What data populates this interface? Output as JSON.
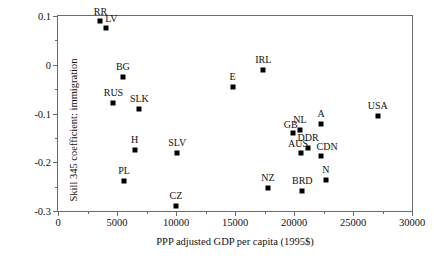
{
  "chart_data": {
    "type": "scatter",
    "title": "",
    "xlabel": "PPP adjusted GDP per capita (1995$)",
    "ylabel": "Skill 345 coefficient: immigration",
    "xlim": [
      0,
      30000
    ],
    "ylim": [
      -0.3,
      0.1
    ],
    "grid": false,
    "legend": "none",
    "xticks": [
      {
        "value": 0,
        "label": "0"
      },
      {
        "value": 5000,
        "label": "5000"
      },
      {
        "value": 10000,
        "label": "10000"
      },
      {
        "value": 15000,
        "label": "15000"
      },
      {
        "value": 20000,
        "label": "20000"
      },
      {
        "value": 25000,
        "label": "25000"
      },
      {
        "value": 30000,
        "label": "30000"
      }
    ],
    "xminorticks": [
      2500,
      7500,
      12500,
      17500,
      22500,
      27500
    ],
    "yticks": [
      {
        "value": 0.1,
        "label": "0.1"
      },
      {
        "value": 0,
        "label": "0"
      },
      {
        "value": -0.1,
        "label": "-0.1"
      },
      {
        "value": -0.2,
        "label": "-0.2"
      },
      {
        "value": -0.3,
        "label": "-0.3"
      }
    ],
    "yminorticks": [
      0.05,
      -0.05,
      -0.15,
      -0.25
    ],
    "points": [
      {
        "label": "RR",
        "x": 3600,
        "y": 0.089,
        "label_dx": 0,
        "label_dy": -4
      },
      {
        "label": "LV",
        "x": 4100,
        "y": 0.075,
        "label_dx": 5,
        "label_dy": -4
      },
      {
        "label": "BG",
        "x": 5500,
        "y": -0.025,
        "label_dx": 0,
        "label_dy": -5
      },
      {
        "label": "RUS",
        "x": 4700,
        "y": -0.078,
        "label_dx": 0,
        "label_dy": -5
      },
      {
        "label": "SLK",
        "x": 6900,
        "y": -0.091,
        "label_dx": 0,
        "label_dy": -5
      },
      {
        "label": "H",
        "x": 6500,
        "y": -0.175,
        "label_dx": 0,
        "label_dy": -5
      },
      {
        "label": "PL",
        "x": 5600,
        "y": -0.238,
        "label_dx": 0,
        "label_dy": -5
      },
      {
        "label": "SLV",
        "x": 10100,
        "y": -0.181,
        "label_dx": 0,
        "label_dy": -5
      },
      {
        "label": "CZ",
        "x": 10000,
        "y": -0.29,
        "label_dx": 0,
        "label_dy": -5
      },
      {
        "label": "E",
        "x": 14800,
        "y": -0.045,
        "label_dx": 0,
        "label_dy": -5
      },
      {
        "label": "IRL",
        "x": 17400,
        "y": -0.01,
        "label_dx": 0,
        "label_dy": -5
      },
      {
        "label": "NZ",
        "x": 17800,
        "y": -0.253,
        "label_dx": 0,
        "label_dy": -5
      },
      {
        "label": "NL",
        "x": 20500,
        "y": -0.133,
        "label_dx": 0,
        "label_dy": -5
      },
      {
        "label": "GB",
        "x": 19900,
        "y": -0.139,
        "label_dx": -2,
        "label_dy": -3
      },
      {
        "label": "A",
        "x": 22300,
        "y": -0.122,
        "label_dx": 0,
        "label_dy": -5
      },
      {
        "label": "DDR",
        "x": 21200,
        "y": -0.17,
        "label_dx": 0,
        "label_dy": -5
      },
      {
        "label": "AUS",
        "x": 20600,
        "y": -0.18,
        "label_dx": -3,
        "label_dy": -4
      },
      {
        "label": "CDN",
        "x": 22300,
        "y": -0.187,
        "label_dx": 6,
        "label_dy": -4
      },
      {
        "label": "BRD",
        "x": 20700,
        "y": -0.258,
        "label_dx": 0,
        "label_dy": -5
      },
      {
        "label": "N",
        "x": 22700,
        "y": -0.237,
        "label_dx": 0,
        "label_dy": -5
      },
      {
        "label": "USA",
        "x": 27100,
        "y": -0.105,
        "label_dx": 0,
        "label_dy": -5
      }
    ]
  }
}
